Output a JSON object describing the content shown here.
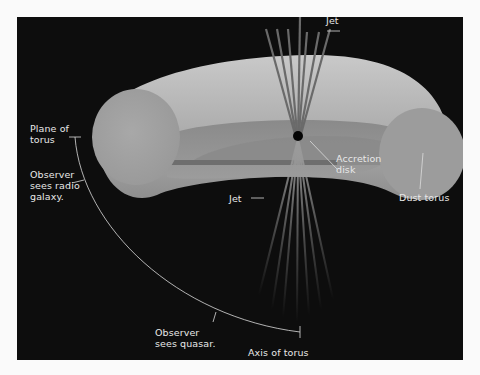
{
  "diagram": {
    "title": "",
    "background_color": "#0d0d0d",
    "frame_color": "#fafafa",
    "torus_color": "#b5b5b5",
    "cross_section_color": "#a2a2a2",
    "disk_color": "#7a7a7a",
    "label_color": "#e8e8e8",
    "labels": {
      "jet_top": "Jet",
      "jet_bottom": "Jet",
      "accretion_disk": "Accretion\ndisk",
      "dust_torus": "Dust torus",
      "plane_of_torus": "Plane of\ntorus",
      "observer_radio_galaxy": "Observer\nsees radio\ngalaxy.",
      "observer_quasar": "Observer\nsees quasar.",
      "axis_of_torus": "Axis of torus"
    },
    "components": [
      {
        "name": "dust-torus",
        "shape": "torus"
      },
      {
        "name": "accretion-disk",
        "shape": "disk"
      },
      {
        "name": "central-black-hole",
        "shape": "dot"
      },
      {
        "name": "jet-upper",
        "shape": "fan of lines"
      },
      {
        "name": "jet-lower",
        "shape": "fan of lines"
      },
      {
        "name": "viewing-angle-arc",
        "shape": "arc from plane of torus to axis of torus"
      }
    ]
  }
}
